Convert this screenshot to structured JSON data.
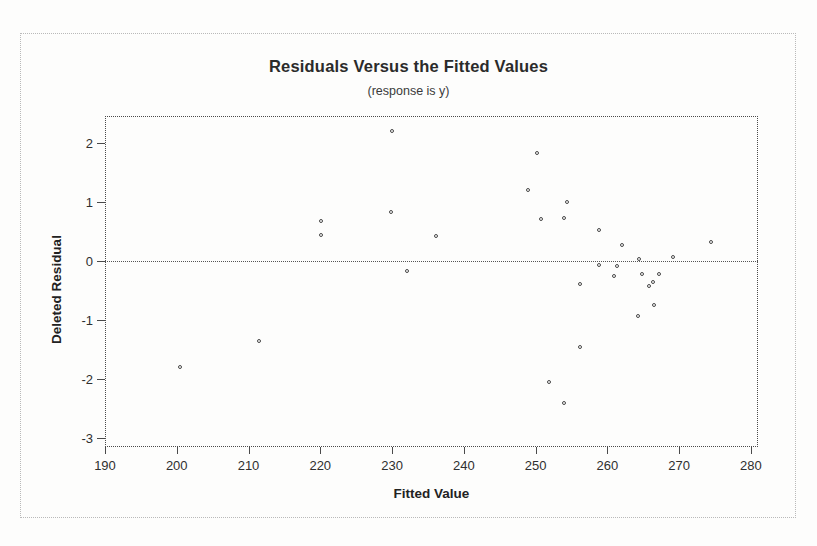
{
  "chart_data": {
    "type": "scatter",
    "title": "Residuals Versus the Fitted Values",
    "subtitle": "(response is y)",
    "xlabel": "Fitted Value",
    "ylabel": "Deleted Residual",
    "xlim": [
      190,
      281
    ],
    "ylim": [
      -3.15,
      2.45
    ],
    "xticks": [
      190,
      200,
      210,
      220,
      230,
      240,
      250,
      260,
      270,
      280
    ],
    "yticks": [
      2,
      1,
      0,
      -1,
      -2,
      -3
    ],
    "grid": false,
    "legend": null,
    "reference_line": {
      "axis": "y",
      "value": 0,
      "style": "dotted"
    },
    "marker": "open-circle",
    "points": [
      {
        "x": 200.4,
        "y": -1.8
      },
      {
        "x": 211.4,
        "y": -1.35
      },
      {
        "x": 220.1,
        "y": 0.68
      },
      {
        "x": 220.1,
        "y": 0.43
      },
      {
        "x": 230.0,
        "y": 2.2
      },
      {
        "x": 229.9,
        "y": 0.83
      },
      {
        "x": 232.1,
        "y": -0.18
      },
      {
        "x": 236.1,
        "y": 0.42
      },
      {
        "x": 250.2,
        "y": 1.82
      },
      {
        "x": 249.0,
        "y": 1.2
      },
      {
        "x": 254.4,
        "y": 1.0
      },
      {
        "x": 250.8,
        "y": 0.71
      },
      {
        "x": 254.0,
        "y": 0.73
      },
      {
        "x": 258.9,
        "y": 0.52
      },
      {
        "x": 262.0,
        "y": 0.27
      },
      {
        "x": 264.4,
        "y": 0.03
      },
      {
        "x": 269.1,
        "y": 0.07
      },
      {
        "x": 274.4,
        "y": 0.32
      },
      {
        "x": 261.3,
        "y": -0.08
      },
      {
        "x": 258.9,
        "y": -0.07
      },
      {
        "x": 261.0,
        "y": -0.25
      },
      {
        "x": 256.2,
        "y": -0.4
      },
      {
        "x": 264.8,
        "y": -0.22
      },
      {
        "x": 267.2,
        "y": -0.22
      },
      {
        "x": 265.8,
        "y": -0.42
      },
      {
        "x": 266.3,
        "y": -0.35
      },
      {
        "x": 264.3,
        "y": -0.94
      },
      {
        "x": 266.5,
        "y": -0.75
      },
      {
        "x": 256.2,
        "y": -1.45
      },
      {
        "x": 251.9,
        "y": -2.05
      },
      {
        "x": 254.0,
        "y": -2.4
      }
    ]
  }
}
